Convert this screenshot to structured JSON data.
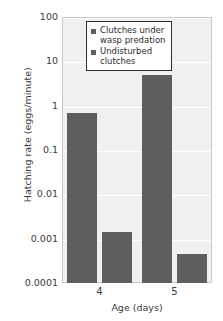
{
  "chart_data": {
    "type": "bar",
    "title": "",
    "xlabel": "Age (days)",
    "ylabel": "Hatching rate (eggs/minute)",
    "categories": [
      "4",
      "5"
    ],
    "yscale": "log",
    "ylim": [
      0.0001,
      100
    ],
    "yticks": [
      "100",
      "10",
      "1",
      "0.1",
      "0.01",
      "0.001",
      "0.0001"
    ],
    "ytick_values": [
      100,
      10,
      1,
      0.1,
      0.01,
      0.001,
      0.0001
    ],
    "grid": true,
    "legend_position": "top-right",
    "series": [
      {
        "name": "Clutches under wasp predation",
        "values": [
          0.7,
          5
        ]
      },
      {
        "name": "Undisturbed clutches",
        "values": [
          0.0014,
          0.00045
        ]
      }
    ],
    "colors": {
      "bar": "#5e5e5e",
      "plot_background": "#f0f0f0",
      "gridline": "#ffffff",
      "text": "#3a3a3a"
    }
  },
  "legend": {
    "entries": [
      {
        "label": "Clutches under\nwasp predation"
      },
      {
        "label": "Undisturbed\nclutches"
      }
    ]
  }
}
